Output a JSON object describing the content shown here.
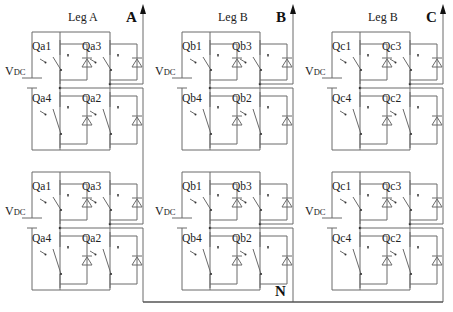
{
  "diagram": {
    "neutral_label": "N",
    "colors": {
      "wire": "#6a6a6a",
      "text": "#222222",
      "background": "#ffffff"
    },
    "phases": [
      {
        "leg_label": "Leg A",
        "output_label": "A",
        "cells": [
          {
            "source_label": "V",
            "source_sub": "DC",
            "switches": [
              "Qa1",
              "Qa3",
              "Qa4",
              "Qa2"
            ]
          },
          {
            "source_label": "V",
            "source_sub": "DC",
            "switches": [
              "Qa1",
              "Qa3",
              "Qa4",
              "Qa2"
            ]
          }
        ]
      },
      {
        "leg_label": "Leg B",
        "output_label": "B",
        "cells": [
          {
            "source_label": "V",
            "source_sub": "DC",
            "switches": [
              "Qb1",
              "Qb3",
              "Qb4",
              "Qb2"
            ]
          },
          {
            "source_label": "V",
            "source_sub": "DC",
            "switches": [
              "Qb1",
              "Qb3",
              "Qb4",
              "Qb2"
            ]
          }
        ]
      },
      {
        "leg_label": "Leg B",
        "output_label": "C",
        "cells": [
          {
            "source_label": "V",
            "source_sub": "DC",
            "switches": [
              "Qc1",
              "Qc3",
              "Qc4",
              "Qc2"
            ]
          },
          {
            "source_label": "V",
            "source_sub": "DC",
            "switches": [
              "Qc1",
              "Qc3",
              "Qc4",
              "Qc2"
            ]
          }
        ]
      }
    ]
  }
}
